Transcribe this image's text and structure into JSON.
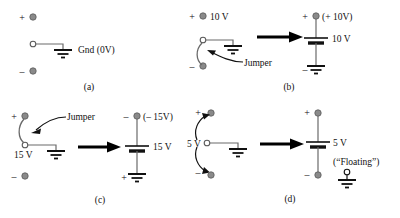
{
  "figure": {
    "colors": {
      "terminal_fill": "#8a8a8a",
      "terminal_stroke": "#5a5a5a",
      "wire": "#3a3a3a",
      "ink": "#111111",
      "background": "#ffffff"
    }
  },
  "panels": [
    {
      "id": "a",
      "caption": "(a)",
      "left": {
        "terminals": [
          {
            "name": "plus",
            "sign": "+"
          },
          {
            "name": "common",
            "sign": ""
          },
          {
            "name": "minus",
            "sign": "–"
          }
        ],
        "ground_label": "Gnd (0V)"
      }
    },
    {
      "id": "b",
      "caption": "(b)",
      "left": {
        "terminals": [
          {
            "name": "plus",
            "sign": "+"
          },
          {
            "name": "common",
            "sign": ""
          },
          {
            "name": "minus",
            "sign": "–"
          }
        ],
        "supply_label": "10 V",
        "jumper_label": "Jumper"
      },
      "right": {
        "top_sign": "+",
        "top_label": "(+ 10V)",
        "battery_label": "10 V",
        "bottom_sign": "–"
      }
    },
    {
      "id": "c",
      "caption": "(c)",
      "left": {
        "terminals": [
          {
            "name": "plus",
            "sign": "+"
          },
          {
            "name": "common",
            "sign": ""
          },
          {
            "name": "minus",
            "sign": "–"
          }
        ],
        "supply_label": "15 V",
        "jumper_label": "Jumper"
      },
      "right": {
        "top_sign": "–",
        "top_label": "(– 15V)",
        "battery_label": "15 V",
        "bottom_sign": "+"
      }
    },
    {
      "id": "d",
      "caption": "(d)",
      "left": {
        "terminals": [
          {
            "name": "plus",
            "sign": "+"
          },
          {
            "name": "common",
            "sign": ""
          },
          {
            "name": "minus",
            "sign": "–"
          }
        ],
        "supply_label": "5 V"
      },
      "right": {
        "top_sign": "+",
        "battery_label": "5 V",
        "bottom_sign": "–",
        "floating_label": "(“Floating”)"
      }
    }
  ]
}
